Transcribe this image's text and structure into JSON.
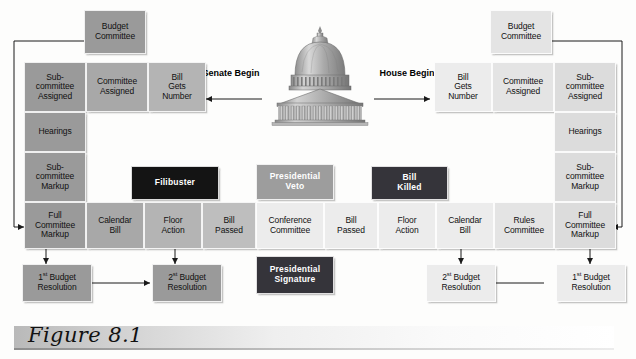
{
  "figure": {
    "caption": "Figure 8.1",
    "center_icon": "capitol-building-icon"
  },
  "flow_labels": {
    "senate": "Senate\nBegin",
    "senate_line1": "Senate",
    "senate_line2": "Begin",
    "house_line1": "House",
    "house_line2": "Begin"
  },
  "senate_side": {
    "budget_committee": "Budget\nCommittee",
    "budget_committee_l1": "Budget",
    "budget_committee_l2": "Committee",
    "intake_row": [
      {
        "l1": "Sub-",
        "l2": "committee",
        "l3": "Assigned"
      },
      {
        "l1": "Committee",
        "l2": "Assigned"
      },
      {
        "l1": "Bill",
        "l2": "Gets",
        "l3": "Number"
      }
    ],
    "column": [
      {
        "l1": "Hearings"
      },
      {
        "l1": "Sub-",
        "l2": "committee",
        "l3": "Markup"
      }
    ],
    "obstacle": "Filibuster",
    "resolution_1_num": "1",
    "resolution_1_sup": "st",
    "resolution_1_rest": " Budget",
    "resolution_1_l2": "Resolution",
    "resolution_2_num": "2",
    "resolution_2_sup": "st",
    "resolution_2_rest": " Budget",
    "resolution_2_l2": "Resolution"
  },
  "house_side": {
    "budget_committee_l1": "Budget",
    "budget_committee_l2": "Committee",
    "intake_row": [
      {
        "l1": "Bill",
        "l2": "Gets",
        "l3": "Number"
      },
      {
        "l1": "Committee",
        "l2": "Assigned"
      },
      {
        "l1": "Sub-",
        "l2": "committee",
        "l3": "Assigned"
      }
    ],
    "column": [
      {
        "l1": "Hearings"
      },
      {
        "l1": "Sub-",
        "l2": "committee",
        "l3": "Markup"
      }
    ],
    "obstacle_l1": "Bill",
    "obstacle_l2": "Killed",
    "resolution_1_num": "1",
    "resolution_1_sup": "st",
    "resolution_1_rest": " Budget",
    "resolution_1_l2": "Resolution",
    "resolution_2_num": "2",
    "resolution_2_sup": "st",
    "resolution_2_rest": " Budget",
    "resolution_2_l2": "Resolution"
  },
  "main_row": [
    {
      "l1": "Full",
      "l2": "Committee",
      "l3": "Markup"
    },
    {
      "l1": "Calendar",
      "l2": "Bill"
    },
    {
      "l1": "Floor",
      "l2": "Action"
    },
    {
      "l1": "Bill",
      "l2": "Passed"
    },
    {
      "l1": "Conference",
      "l2": "Committee"
    },
    {
      "l1": "Bill",
      "l2": "Passed"
    },
    {
      "l1": "Floor",
      "l2": "Action"
    },
    {
      "l1": "Calendar",
      "l2": "Bill"
    },
    {
      "l1": "Rules",
      "l2": "Committee"
    },
    {
      "l1": "Full",
      "l2": "Committee",
      "l3": "Markup"
    }
  ],
  "center_outcomes": {
    "veto_l1": "Presidential",
    "veto_l2": "Veto",
    "signature_l1": "Presidential",
    "signature_l2": "Signature"
  },
  "colors": {
    "dark_box": "#141414",
    "dark_box_alt": "#35343a",
    "veto_box": "#9d9d9d",
    "outer_grey": "#9a9a9a",
    "center_grey": "#ececec",
    "page_bg": "#fdfdfc"
  }
}
